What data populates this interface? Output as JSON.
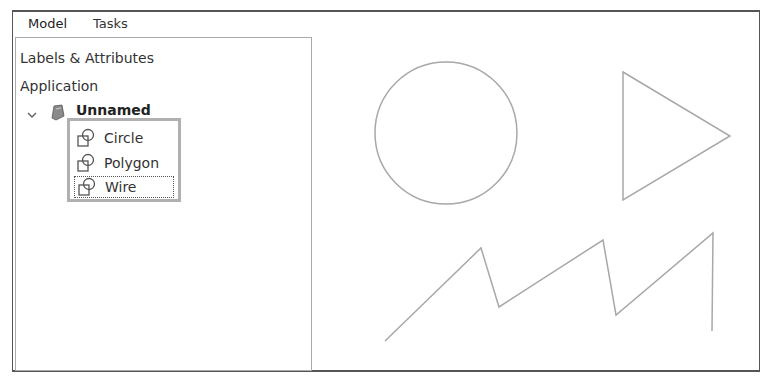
{
  "tabs": [
    {
      "label": "Model",
      "active": true
    },
    {
      "label": "Tasks",
      "active": false
    }
  ],
  "tree": {
    "header": "Labels & Attributes",
    "root_label": "Application",
    "document": {
      "label": "Unnamed",
      "expanded": true,
      "icon": "document-icon"
    },
    "items": [
      {
        "label": "Circle",
        "icon": "shape-icon",
        "selected": false
      },
      {
        "label": "Polygon",
        "icon": "shape-icon",
        "selected": false
      },
      {
        "label": "Wire",
        "icon": "shape-icon",
        "selected": true
      }
    ]
  },
  "viewer": {
    "stroke_color": "#a8a8a8",
    "shapes": [
      {
        "type": "circle",
        "cx": 446,
        "cy": 133,
        "r": 71
      },
      {
        "type": "polygon",
        "points": "623,72 730,136 623,200"
      },
      {
        "type": "wire",
        "points": "385,341 481,248 499,307 603,240 616,315 713,233 712,331"
      }
    ]
  }
}
